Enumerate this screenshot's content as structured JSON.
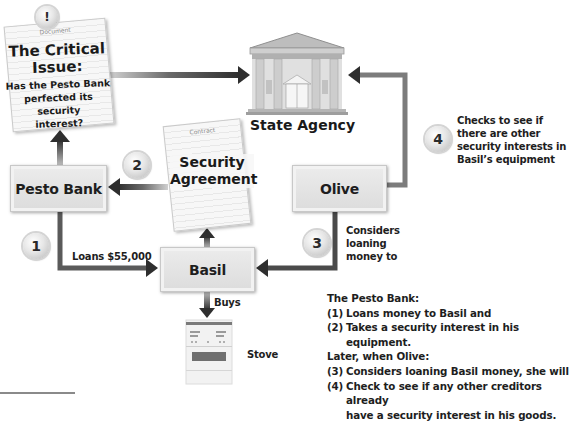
{
  "diagram": {
    "critical_issue": {
      "badge_icon": "exclamation-icon",
      "badge_glyph": "!",
      "doc_type": "Document",
      "title_line1": "The Critical",
      "title_line2": "Issue:",
      "question_line1": "Has the Pesto Bank",
      "question_line2": "perfected its security",
      "question_line3": "interest?"
    },
    "state_agency": {
      "icon": "government-building-icon",
      "label": "State Agency"
    },
    "security_agreement": {
      "doc_type": "Contract",
      "title_line1": "Security",
      "title_line2": "Agreement"
    },
    "nodes": {
      "pesto_bank": "Pesto Bank",
      "olive": "Olive",
      "basil": "Basil",
      "stove": "Stove"
    },
    "steps": [
      {
        "number": "1",
        "text": "Loans $55,000"
      },
      {
        "number": "2",
        "text": ""
      },
      {
        "number": "3",
        "lines": [
          "Considers",
          "loaning",
          "money to"
        ]
      },
      {
        "number": "4",
        "lines": [
          "Checks to see if",
          "there are other",
          "security interests in",
          "Basil’s equipment"
        ]
      }
    ],
    "buys_label": "Buys",
    "summary": {
      "heading": "The Pesto Bank:",
      "items": [
        {
          "num": "(1)",
          "text": "Loans money to Basil and"
        },
        {
          "num": "(2)",
          "text": "Takes a security interest in his equipment."
        }
      ],
      "subheading": "Later, when Olive:",
      "items2": [
        {
          "num": "(3)",
          "text": "Considers loaning Basil money, she will"
        },
        {
          "num": "(4)",
          "text": "Check to see if any other creditors already",
          "text2": "have a security interest in his goods."
        }
      ]
    },
    "colors": {
      "arrow_dark": "#2e2e2e",
      "arrow_light": "#9a9a9a",
      "box_fill": "#e2e2e2",
      "badge_fill": "#e6e6e6"
    }
  }
}
